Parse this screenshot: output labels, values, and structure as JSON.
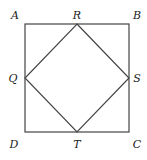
{
  "diagram": {
    "type": "geometry",
    "outer_square": {
      "vertices": [
        "A",
        "B",
        "C",
        "D"
      ],
      "coords": {
        "A": [
          25,
          24
        ],
        "B": [
          129,
          24
        ],
        "C": [
          129,
          132
        ],
        "D": [
          25,
          132
        ]
      }
    },
    "inner_square": {
      "vertices": [
        "R",
        "S",
        "T",
        "Q"
      ],
      "coords": {
        "R": [
          77,
          24
        ],
        "S": [
          129,
          78
        ],
        "T": [
          77,
          132
        ],
        "Q": [
          25,
          78
        ]
      }
    },
    "labels": {
      "A": {
        "text": "A",
        "x": 15,
        "y": 19
      },
      "B": {
        "text": "B",
        "x": 136,
        "y": 19
      },
      "C": {
        "text": "C",
        "x": 136,
        "y": 148
      },
      "D": {
        "text": "D",
        "x": 14,
        "y": 148
      },
      "R": {
        "text": "R",
        "x": 77,
        "y": 19
      },
      "S": {
        "text": "S",
        "x": 136,
        "y": 82
      },
      "T": {
        "text": "T",
        "x": 77,
        "y": 148
      },
      "Q": {
        "text": "Q",
        "x": 13,
        "y": 82
      }
    },
    "colors": {
      "line": "#444444",
      "text": "#222222",
      "background": "#ffffff"
    }
  }
}
